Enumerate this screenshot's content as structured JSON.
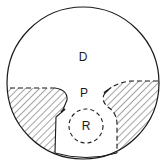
{
  "diagram": {
    "type": "region-schematic",
    "labels": {
      "upper_region": "D",
      "middle_region": "P",
      "inner_circle": "R"
    },
    "colors": {
      "stroke": "#1a1a1a",
      "background": "#ffffff"
    },
    "elements": [
      {
        "name": "outer-circle",
        "style": "solid"
      },
      {
        "name": "left-hatched-region",
        "style": "hatched, dashed top boundary"
      },
      {
        "name": "right-hatched-region",
        "style": "hatched, dashed top and inner boundary"
      },
      {
        "name": "inner-circle-R",
        "style": "dashed"
      }
    ]
  }
}
